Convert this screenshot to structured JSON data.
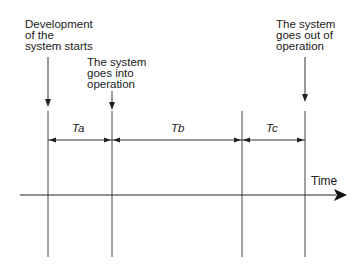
{
  "diagram": {
    "events": [
      {
        "id": "dev-start",
        "lines": [
          "Development",
          "of the",
          "system starts"
        ]
      },
      {
        "id": "into-op",
        "lines": [
          "The system",
          "goes into",
          "operation"
        ]
      },
      {
        "id": "out-of-op",
        "lines": [
          "The system",
          "goes out of",
          "operation"
        ]
      }
    ],
    "intervals": [
      {
        "label": "Ta"
      },
      {
        "label": "Tb"
      },
      {
        "label": "Tc"
      }
    ],
    "axis": {
      "label": "Time"
    },
    "colors": {
      "line": "#333333",
      "text": "#1a1a1a",
      "background": "#ffffff"
    }
  }
}
